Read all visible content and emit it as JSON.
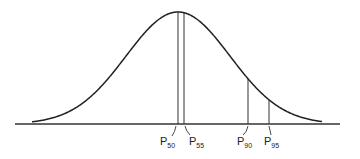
{
  "chart_data": {
    "type": "line",
    "title": "",
    "xlabel": "",
    "ylabel": "",
    "curve": {
      "distribution": "normal",
      "mean_px": 178,
      "sd_px": 52
    },
    "axis": {
      "x_start": 15,
      "x_end": 340,
      "y": 124
    },
    "grid": false,
    "legend": null,
    "markers": [
      {
        "label": "P",
        "subscript": "50",
        "percentile": 50,
        "x": 178
      },
      {
        "label": "P",
        "subscript": "55",
        "percentile": 55,
        "x": 184
      },
      {
        "label": "P",
        "subscript": "90",
        "percentile": 90,
        "x": 248
      },
      {
        "label": "P",
        "subscript": "95",
        "percentile": 95,
        "x": 269
      }
    ]
  },
  "labels": {
    "p50": {
      "main": "P",
      "sub": "50"
    },
    "p55": {
      "main": "P",
      "sub": "55"
    },
    "p90": {
      "main": "P",
      "sub": "90"
    },
    "p95": {
      "main": "P",
      "sub": "95"
    }
  }
}
